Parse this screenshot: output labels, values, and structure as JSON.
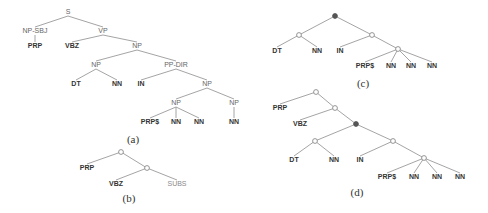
{
  "figure": {
    "colors": {
      "edge": "#9a9a9a",
      "text": "#666666",
      "bold_text": "#333333",
      "filled_node": "#555555"
    },
    "trees": [
      {
        "id": "a",
        "caption": "(a)",
        "caption_pos": [
          133,
          143
        ],
        "nodes": [
          {
            "id": "S",
            "label": "S",
            "x": 68,
            "y": 14,
            "style": "normal"
          },
          {
            "id": "NPSBJ",
            "label": "NP-SBJ",
            "x": 35,
            "y": 33,
            "style": "normal"
          },
          {
            "id": "PRP",
            "label": "PRP",
            "x": 35,
            "y": 48,
            "style": "bold"
          },
          {
            "id": "VP",
            "label": "VP",
            "x": 103,
            "y": 33,
            "style": "normal"
          },
          {
            "id": "VBZ",
            "label": "VBZ",
            "x": 72,
            "y": 48,
            "style": "bold"
          },
          {
            "id": "NP1",
            "label": "NP",
            "x": 137,
            "y": 48,
            "style": "normal"
          },
          {
            "id": "NP2",
            "label": "NP",
            "x": 96,
            "y": 67,
            "style": "normal"
          },
          {
            "id": "PPDIR",
            "label": "PP-DIR",
            "x": 176,
            "y": 67,
            "style": "normal"
          },
          {
            "id": "DT",
            "label": "DT",
            "x": 76,
            "y": 86,
            "style": "bold"
          },
          {
            "id": "NN1",
            "label": "NN",
            "x": 117,
            "y": 86,
            "style": "bold"
          },
          {
            "id": "IN",
            "label": "IN",
            "x": 141,
            "y": 86,
            "style": "bold"
          },
          {
            "id": "NP3",
            "label": "NP",
            "x": 207,
            "y": 86,
            "style": "normal"
          },
          {
            "id": "NP4",
            "label": "NP",
            "x": 176,
            "y": 105,
            "style": "normal"
          },
          {
            "id": "NP5",
            "label": "NP",
            "x": 234,
            "y": 105,
            "style": "normal"
          },
          {
            "id": "PRPS",
            "label": "PRP$",
            "x": 150,
            "y": 124,
            "style": "bold"
          },
          {
            "id": "NN2",
            "label": "NN",
            "x": 176,
            "y": 124,
            "style": "bold"
          },
          {
            "id": "NN3",
            "label": "NN",
            "x": 199,
            "y": 124,
            "style": "bold"
          },
          {
            "id": "NN4",
            "label": "NN",
            "x": 234,
            "y": 124,
            "style": "bold"
          }
        ],
        "edges": [
          [
            "S",
            "NPSBJ"
          ],
          [
            "S",
            "VP"
          ],
          [
            "NPSBJ",
            "PRP"
          ],
          [
            "VP",
            "VBZ"
          ],
          [
            "VP",
            "NP1"
          ],
          [
            "NP1",
            "NP2"
          ],
          [
            "NP1",
            "PPDIR"
          ],
          [
            "NP2",
            "DT"
          ],
          [
            "NP2",
            "NN1"
          ],
          [
            "PPDIR",
            "IN"
          ],
          [
            "PPDIR",
            "NP3"
          ],
          [
            "NP3",
            "NP4"
          ],
          [
            "NP3",
            "NP5"
          ],
          [
            "NP4",
            "PRPS"
          ],
          [
            "NP4",
            "NN2"
          ],
          [
            "NP4",
            "NN3"
          ],
          [
            "NP5",
            "NN4"
          ]
        ]
      },
      {
        "id": "b",
        "caption": "(b)",
        "caption_pos": [
          129,
          202
        ],
        "nodes": [
          {
            "id": "R",
            "label": "",
            "x": 121,
            "y": 152,
            "style": "open"
          },
          {
            "id": "PRP",
            "label": "PRP",
            "x": 87,
            "y": 170,
            "style": "bold"
          },
          {
            "id": "C",
            "label": "",
            "x": 147,
            "y": 168,
            "style": "open"
          },
          {
            "id": "VBZ",
            "label": "VBZ",
            "x": 116,
            "y": 186,
            "style": "bold"
          },
          {
            "id": "SUBS",
            "label": "SUBS",
            "x": 177,
            "y": 186,
            "style": "light"
          }
        ],
        "edges": [
          [
            "R",
            "PRP"
          ],
          [
            "R",
            "C"
          ],
          [
            "C",
            "VBZ"
          ],
          [
            "C",
            "SUBS"
          ]
        ]
      },
      {
        "id": "c",
        "caption": "(c)",
        "caption_pos": [
          363,
          87
        ],
        "nodes": [
          {
            "id": "R",
            "label": "",
            "x": 335,
            "y": 16,
            "style": "filled"
          },
          {
            "id": "L",
            "label": "",
            "x": 299,
            "y": 35,
            "style": "open"
          },
          {
            "id": "Rt",
            "label": "",
            "x": 372,
            "y": 35,
            "style": "open"
          },
          {
            "id": "DT",
            "label": "DT",
            "x": 277,
            "y": 53,
            "style": "bold"
          },
          {
            "id": "NN1",
            "label": "NN",
            "x": 317,
            "y": 53,
            "style": "bold"
          },
          {
            "id": "IN",
            "label": "IN",
            "x": 340,
            "y": 53,
            "style": "bold"
          },
          {
            "id": "D",
            "label": "",
            "x": 398,
            "y": 49,
            "style": "open"
          },
          {
            "id": "PRPS",
            "label": "PRP$",
            "x": 365,
            "y": 68,
            "style": "bold"
          },
          {
            "id": "NN2",
            "label": "NN",
            "x": 391,
            "y": 68,
            "style": "bold"
          },
          {
            "id": "NN3",
            "label": "NN",
            "x": 411,
            "y": 68,
            "style": "bold"
          },
          {
            "id": "NN4",
            "label": "NN",
            "x": 432,
            "y": 68,
            "style": "bold"
          }
        ],
        "edges": [
          [
            "R",
            "L"
          ],
          [
            "R",
            "Rt"
          ],
          [
            "L",
            "DT"
          ],
          [
            "L",
            "NN1"
          ],
          [
            "Rt",
            "IN"
          ],
          [
            "Rt",
            "D"
          ],
          [
            "D",
            "PRPS"
          ],
          [
            "D",
            "NN2"
          ],
          [
            "D",
            "NN3"
          ],
          [
            "D",
            "NN4"
          ]
        ]
      },
      {
        "id": "d",
        "caption": "(d)",
        "caption_pos": [
          357,
          196
        ],
        "nodes": [
          {
            "id": "R",
            "label": "",
            "x": 316,
            "y": 92,
            "style": "open"
          },
          {
            "id": "PRP",
            "label": "PRP",
            "x": 280,
            "y": 110,
            "style": "bold"
          },
          {
            "id": "A",
            "label": "",
            "x": 335,
            "y": 108,
            "style": "open"
          },
          {
            "id": "VBZ",
            "label": "VBZ",
            "x": 300,
            "y": 126,
            "style": "bold"
          },
          {
            "id": "B",
            "label": "",
            "x": 356,
            "y": 124,
            "style": "filled"
          },
          {
            "id": "L",
            "label": "",
            "x": 315,
            "y": 141,
            "style": "open"
          },
          {
            "id": "Rt",
            "label": "",
            "x": 393,
            "y": 141,
            "style": "open"
          },
          {
            "id": "DT",
            "label": "DT",
            "x": 294,
            "y": 162,
            "style": "bold"
          },
          {
            "id": "NN1",
            "label": "NN",
            "x": 334,
            "y": 162,
            "style": "bold"
          },
          {
            "id": "IN",
            "label": "IN",
            "x": 360,
            "y": 162,
            "style": "bold"
          },
          {
            "id": "D",
            "label": "",
            "x": 424,
            "y": 158,
            "style": "open"
          },
          {
            "id": "PRPS",
            "label": "PRP$",
            "x": 387,
            "y": 179,
            "style": "bold"
          },
          {
            "id": "NN2",
            "label": "NN",
            "x": 414,
            "y": 179,
            "style": "bold"
          },
          {
            "id": "NN3",
            "label": "NN",
            "x": 437,
            "y": 179,
            "style": "bold"
          },
          {
            "id": "NN4",
            "label": "NN",
            "x": 460,
            "y": 179,
            "style": "bold"
          }
        ],
        "edges": [
          [
            "R",
            "PRP"
          ],
          [
            "R",
            "A"
          ],
          [
            "A",
            "VBZ"
          ],
          [
            "A",
            "B"
          ],
          [
            "B",
            "L"
          ],
          [
            "B",
            "Rt"
          ],
          [
            "L",
            "DT"
          ],
          [
            "L",
            "NN1"
          ],
          [
            "Rt",
            "IN"
          ],
          [
            "Rt",
            "D"
          ],
          [
            "D",
            "PRPS"
          ],
          [
            "D",
            "NN2"
          ],
          [
            "D",
            "NN3"
          ],
          [
            "D",
            "NN4"
          ]
        ]
      }
    ]
  }
}
